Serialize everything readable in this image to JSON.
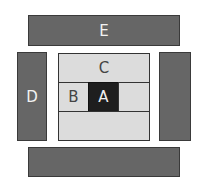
{
  "diagram": {
    "colors": {
      "outer_block": "#666666",
      "inner_light": "#dcdcdc",
      "core": "#1e1e1e",
      "background": "#ffffff"
    },
    "blocks": {
      "top_bar": {
        "label": "E"
      },
      "left_column": {
        "label": "D"
      },
      "right_column": {
        "label": ""
      },
      "bottom_bar": {
        "label": ""
      },
      "center_top": {
        "label": "C"
      },
      "center_left": {
        "label": "B"
      },
      "center_core": {
        "label": "A"
      },
      "center_right": {
        "label": ""
      },
      "center_bottom": {
        "label": ""
      }
    }
  }
}
